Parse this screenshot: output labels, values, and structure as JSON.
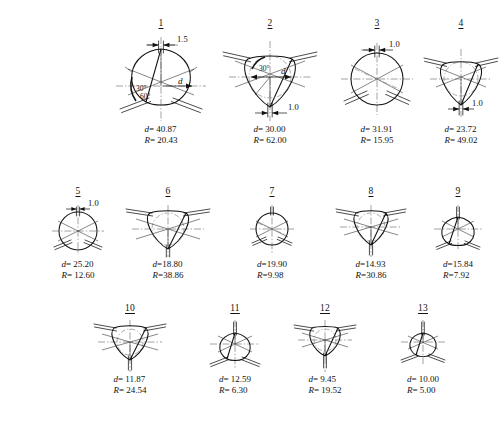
{
  "page": {
    "background_color": "#ffffff",
    "line_color": "#111111",
    "centerline_color": "#555555",
    "width": 502,
    "height": 422
  },
  "caption_symbols": {
    "diameter_symbol": "d",
    "radius_symbol": "R",
    "equals": "=",
    "angle_30": "30°",
    "angle_60": "60°"
  },
  "figures": [
    {
      "number": "1",
      "d_label": "d",
      "d_value": "40.87",
      "r_label": "R",
      "r_value": "20.43",
      "d_text": "= 40.87",
      "r_text": "= 20.43",
      "dimension": "1.5",
      "dimension_position": "top",
      "angles": [
        "30°",
        "60°"
      ],
      "shape": "rounded-triangle-up",
      "has_d_arrow": true,
      "has_inscribed_circle": false
    },
    {
      "number": "2",
      "d_label": "d",
      "d_value": "30.00",
      "r_label": "R",
      "r_value": "62.00",
      "d_text": "= 30.00",
      "r_text": "= 62.00",
      "dimension": "1.0",
      "dimension_position": "bottom",
      "angles": [
        "30°"
      ],
      "shape": "rounded-triangle-down",
      "has_d_arrow": true,
      "has_inscribed_circle": true
    },
    {
      "number": "3",
      "d_label": "d",
      "d_value": "31.91",
      "r_label": "R",
      "r_value": "15.95",
      "d_text": "= 31.91",
      "r_text": "= 15.95",
      "dimension": "1.0",
      "dimension_position": "top",
      "angles": [],
      "shape": "circle",
      "has_d_arrow": false,
      "has_inscribed_circle": false
    },
    {
      "number": "4",
      "d_label": "d",
      "d_value": "23.72",
      "r_label": "R",
      "r_value": "49.02",
      "d_text": "= 23.72",
      "r_text": "= 49.02",
      "dimension": "1.0",
      "dimension_position": "bottom",
      "angles": [],
      "shape": "rounded-triangle-down",
      "has_d_arrow": false,
      "has_inscribed_circle": true
    },
    {
      "number": "5",
      "d_label": "d",
      "d_value": "25.20",
      "r_label": "R",
      "r_value": "12.60",
      "d_text": "= 25.20",
      "r_text": "= 12.60",
      "dimension": "1.0",
      "dimension_position": "top",
      "angles": [],
      "shape": "circle",
      "has_d_arrow": false,
      "has_inscribed_circle": false
    },
    {
      "number": "6",
      "d_label": "d",
      "d_value": "18.80",
      "r_label": "R",
      "r_value": "38.86",
      "d_text": "=18.80",
      "r_text": "=38.86",
      "dimension": "",
      "dimension_position": "",
      "angles": [],
      "shape": "rounded-triangle-down",
      "has_d_arrow": false,
      "has_inscribed_circle": true
    },
    {
      "number": "7",
      "d_label": "d",
      "d_value": "19.90",
      "r_label": "R",
      "r_value": "9.98",
      "d_text": "=19.90",
      "r_text": "=9.98",
      "dimension": "",
      "dimension_position": "",
      "angles": [],
      "shape": "circle",
      "has_d_arrow": false,
      "has_inscribed_circle": false
    },
    {
      "number": "8",
      "d_label": "d",
      "d_value": "14.93",
      "r_label": "R",
      "r_value": "30.86",
      "d_text": "=14.93",
      "r_text": "=30.86",
      "dimension": "",
      "dimension_position": "",
      "angles": [],
      "shape": "rounded-triangle-down",
      "has_d_arrow": false,
      "has_inscribed_circle": true
    },
    {
      "number": "9",
      "d_label": "d",
      "d_value": "15.84",
      "r_label": "R",
      "r_value": "7.92",
      "d_text": "=15.84",
      "r_text": "=7.92",
      "dimension": "",
      "dimension_position": "",
      "angles": [],
      "shape": "rounded-triangle-up",
      "has_d_arrow": false,
      "has_inscribed_circle": false
    },
    {
      "number": "10",
      "d_label": "d",
      "d_value": "11.87",
      "r_label": "R",
      "r_value": "24.54",
      "d_text": "= 11.87",
      "r_text": "= 24.54",
      "dimension": "",
      "dimension_position": "",
      "angles": [],
      "shape": "rounded-triangle-down",
      "has_d_arrow": false,
      "has_inscribed_circle": true
    },
    {
      "number": "11",
      "d_label": "d",
      "d_value": "12.59",
      "r_label": "R",
      "r_value": "6.30",
      "d_text": "= 12.59",
      "r_text": "= 6.30",
      "dimension": "",
      "dimension_position": "",
      "angles": [],
      "shape": "rounded-triangle-up",
      "has_d_arrow": false,
      "has_inscribed_circle": false
    },
    {
      "number": "12",
      "d_label": "d",
      "d_value": "9.45",
      "r_label": "R",
      "r_value": "19.52",
      "d_text": "= 9.45",
      "r_text": "= 19.52",
      "dimension": "",
      "dimension_position": "",
      "angles": [],
      "shape": "rounded-triangle-down",
      "has_d_arrow": false,
      "has_inscribed_circle": true
    },
    {
      "number": "13",
      "d_label": "d",
      "d_value": "10.00",
      "r_label": "R",
      "r_value": "5.00",
      "d_text": "= 10.00",
      "r_text": "= 5.00",
      "dimension": "",
      "dimension_position": "",
      "angles": [],
      "shape": "rounded-triangle-up",
      "has_d_arrow": false,
      "has_inscribed_circle": false
    }
  ]
}
